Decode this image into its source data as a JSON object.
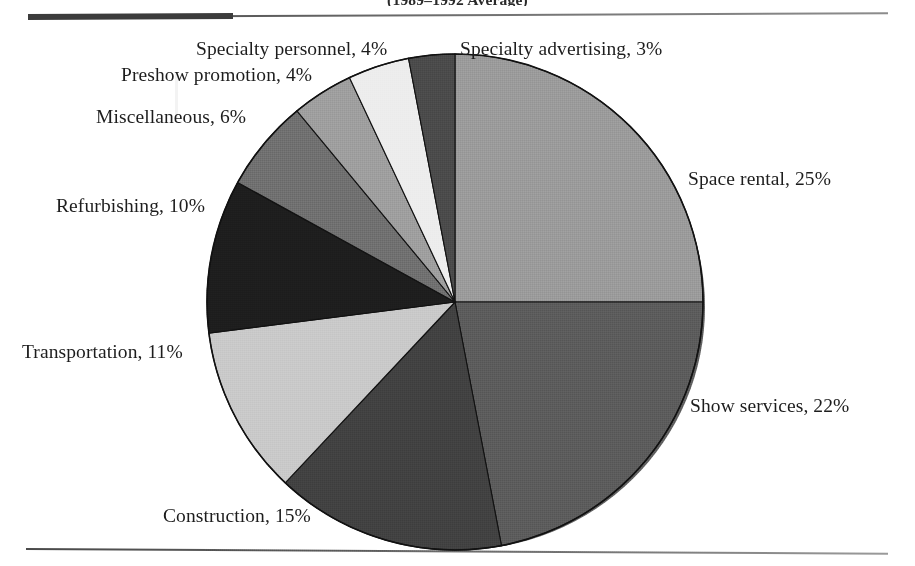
{
  "document": {
    "title_partial": "(1989–1992 Average)",
    "title_note": "top of title cropped by image edge"
  },
  "rules": {
    "top_label": "top-horizontal-rule",
    "bottom_label": "bottom-horizontal-rule"
  },
  "chart_data": {
    "type": "pie",
    "title": "(1989–1992 Average)",
    "xlabel": "",
    "ylabel": "",
    "legend_position": "outside-labels",
    "grid": false,
    "start_angle_deg": 0,
    "direction": "clockwise",
    "units": "percent",
    "categories": [
      "Space rental",
      "Show services",
      "Construction",
      "Transportation",
      "Refurbishing",
      "Miscellaneous",
      "Preshow promotion",
      "Specialty personnel",
      "Specialty advertising"
    ],
    "values": [
      25,
      22,
      15,
      11,
      10,
      6,
      4,
      4,
      3
    ],
    "total": 100,
    "colors": [
      "#9a9a9a",
      "#5b5b5b",
      "#414141",
      "#c9c9c9",
      "#1d1d1d",
      "#6f6f6f",
      "#9e9e9e",
      "#ededed",
      "#4a4a4a"
    ],
    "slices": [
      {
        "label": "Space rental, 25%",
        "name": "Space rental",
        "value": 25,
        "color": "#9a9a9a"
      },
      {
        "label": "Show services, 22%",
        "name": "Show services",
        "value": 22,
        "color": "#5b5b5b"
      },
      {
        "label": "Construction, 15%",
        "name": "Construction",
        "value": 15,
        "color": "#414141"
      },
      {
        "label": "Transportation, 11%",
        "name": "Transportation",
        "value": 11,
        "color": "#c9c9c9"
      },
      {
        "label": "Refurbishing, 10%",
        "name": "Refurbishing",
        "value": 10,
        "color": "#1d1d1d"
      },
      {
        "label": "Miscellaneous, 6%",
        "name": "Miscellaneous",
        "value": 6,
        "color": "#6f6f6f"
      },
      {
        "label": "Preshow promotion, 4%",
        "name": "Preshow promotion",
        "value": 4,
        "color": "#9e9e9e"
      },
      {
        "label": "Specialty personnel, 4%",
        "name": "Specialty personnel",
        "value": 4,
        "color": "#ededed"
      },
      {
        "label": "Specialty advertising, 3%",
        "name": "Specialty advertising",
        "value": 3,
        "color": "#4a4a4a"
      }
    ]
  },
  "labels": {
    "space_rental": "Space rental, 25%",
    "show_services": "Show services, 22%",
    "construction": "Construction, 15%",
    "transportation": "Transportation, 11%",
    "refurbishing": "Refurbishing, 10%",
    "miscellaneous": "Miscellaneous, 6%",
    "preshow_promotion": "Preshow promotion, 4%",
    "specialty_personnel": "Specialty personnel, 4%",
    "specialty_advertising": "Specialty advertising, 3%"
  }
}
